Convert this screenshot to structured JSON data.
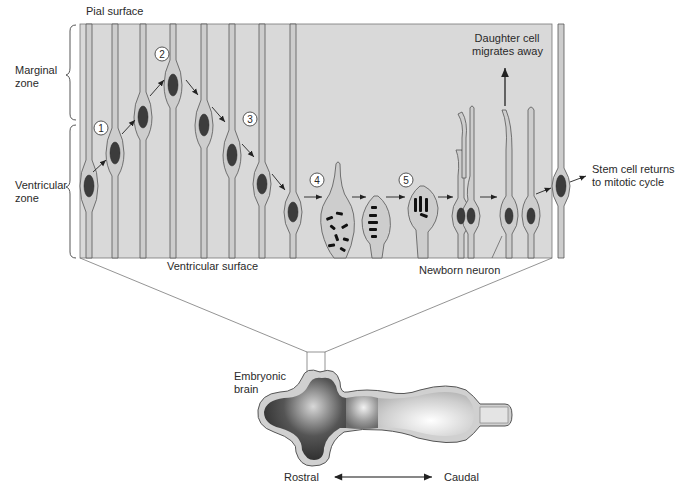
{
  "diagram": {
    "title_hidden": "Neurogenesis in the ventricular zone of the embryonic brain",
    "colors": {
      "tissue_bg": "#d9d9d9",
      "cell_fill": "#c8c8c8",
      "outline": "#555555",
      "nucleus": "#3a3a3a",
      "chromosome": "#111111",
      "step_circle_fill": "#ffffff"
    },
    "labels": {
      "pial_surface": "Pial surface",
      "marginal_zone_line1": "Marginal",
      "marginal_zone_line2": "zone",
      "ventricular_zone_line1": "Ventricular",
      "ventricular_zone_line2": "zone",
      "ventricular_surface": "Ventricular surface",
      "daughter_line1": "Daughter cell",
      "daughter_line2": "migrates away",
      "stem_line1": "Stem cell returns",
      "stem_line2": "to mitotic cycle",
      "newborn_neuron": "Newborn neuron",
      "embryonic_line1": "Embryonic",
      "embryonic_line2": "brain",
      "rostral": "Rostral",
      "caudal": "Caudal"
    },
    "steps": [
      {
        "n": "1",
        "meaning": "nucleus migrates toward pial surface"
      },
      {
        "n": "2",
        "meaning": "DNA replication at top"
      },
      {
        "n": "3",
        "meaning": "nucleus migrates back toward ventricular surface"
      },
      {
        "n": "4",
        "meaning": "cell retracts process, chromosomes condense"
      },
      {
        "n": "5",
        "meaning": "mitosis / cell division"
      }
    ],
    "zones": [
      {
        "name": "Marginal zone",
        "bracket_top": 25,
        "bracket_bottom": 120
      },
      {
        "name": "Ventricular zone",
        "bracket_top": 125,
        "bracket_bottom": 258
      }
    ],
    "axis": {
      "left": "Rostral",
      "right": "Caudal",
      "type": "bidirectional-arrow"
    }
  }
}
